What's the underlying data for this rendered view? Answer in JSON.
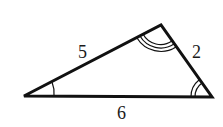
{
  "figure": {
    "type": "triangle",
    "vertices": {
      "A": {
        "x": 24,
        "y": 96
      },
      "B": {
        "x": 161,
        "y": 25
      },
      "C": {
        "x": 212,
        "y": 97
      }
    },
    "sides": [
      {
        "id": "AB",
        "label": "5"
      },
      {
        "id": "BC",
        "label": "2"
      },
      {
        "id": "AC",
        "label": "6"
      }
    ],
    "angle_marks": [
      {
        "vertex": "A",
        "arcs": 1
      },
      {
        "vertex": "B",
        "arcs": 3
      },
      {
        "vertex": "C",
        "arcs": 2
      }
    ],
    "colors": {
      "stroke": "#111111",
      "background": "#ffffff"
    }
  }
}
